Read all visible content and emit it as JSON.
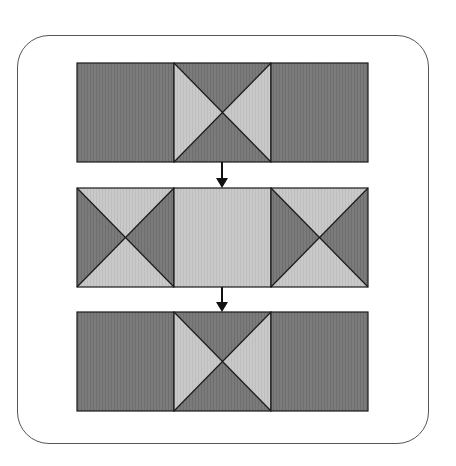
{
  "diagram": {
    "title": "",
    "colors": {
      "dark": "#7b7b7b",
      "dark_stripe": "#6e6e6e",
      "light": "#c9c9c9",
      "light_stripe": "#bebebe",
      "stroke": "#1a1a1a",
      "frame": "#555555"
    },
    "rows": [
      {
        "id": "row-1",
        "cells": [
          {
            "type": "solid",
            "fill": "dark"
          },
          {
            "type": "hourglass",
            "top_bottom": "dark",
            "left_right": "light"
          },
          {
            "type": "solid",
            "fill": "dark"
          }
        ]
      },
      {
        "id": "row-2",
        "cells": [
          {
            "type": "hourglass",
            "top_bottom": "light",
            "left_right": "dark"
          },
          {
            "type": "solid",
            "fill": "light"
          },
          {
            "type": "hourglass",
            "top_bottom": "light",
            "left_right": "dark"
          }
        ]
      },
      {
        "id": "row-3",
        "cells": [
          {
            "type": "solid",
            "fill": "dark"
          },
          {
            "type": "hourglass",
            "top_bottom": "dark",
            "left_right": "light"
          },
          {
            "type": "solid",
            "fill": "dark"
          }
        ]
      }
    ],
    "arrows": [
      {
        "from": "row-1",
        "to": "row-2",
        "direction": "down"
      },
      {
        "from": "row-2",
        "to": "row-3",
        "direction": "down"
      }
    ]
  }
}
